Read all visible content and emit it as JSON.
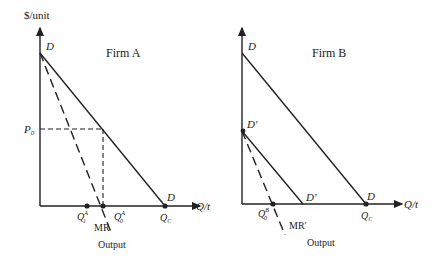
{
  "y_axis_label": "$/unit",
  "x_axis_label": "Q/t",
  "output_label": "Output",
  "colors": {
    "line": "#222222",
    "background": "#ffffff"
  },
  "firm_a": {
    "title": "Firm A",
    "demand_label_top": "D",
    "demand_label_bottom": "D",
    "price_label": "P",
    "price_sub": "0",
    "mr_label": "MR",
    "q1_label": "Q",
    "q1_sub": "1",
    "q1_sup": "A",
    "q0_label": "Q",
    "q0_sub": "0",
    "q0_sup": "A",
    "qc_label": "Q",
    "qc_sub": "C"
  },
  "firm_b": {
    "title": "Firm B",
    "demand_label_top": "D",
    "demand_label_bottom": "D",
    "demand_prime_top": "D′",
    "demand_prime_bottom": "D′",
    "mr_label": "MR′",
    "q0_label": "Q",
    "q0_sub": "0",
    "q0_sup": "B",
    "qc_label": "Q",
    "qc_sub": "C"
  }
}
